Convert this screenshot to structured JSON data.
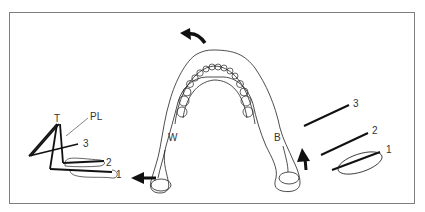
{
  "figure": {
    "labels": {
      "tooth_point": "T",
      "plane_line": "PL",
      "working_side": "W",
      "balancing_side": "B",
      "left_lines": [
        "1",
        "2",
        "3"
      ],
      "right_lines": [
        "1",
        "2",
        "3"
      ]
    },
    "colors": {
      "line": "#111111",
      "frame": "#7d7d7d",
      "text": "#333333",
      "background": "#ffffff"
    },
    "arrows": [
      {
        "name": "rotation-arrow",
        "location": "top of arch",
        "direction": "up-left"
      },
      {
        "name": "working-side-arrow",
        "location": "left condyle",
        "direction": "left"
      },
      {
        "name": "balancing-side-arrow",
        "location": "right condyle",
        "direction": "up"
      }
    ]
  }
}
